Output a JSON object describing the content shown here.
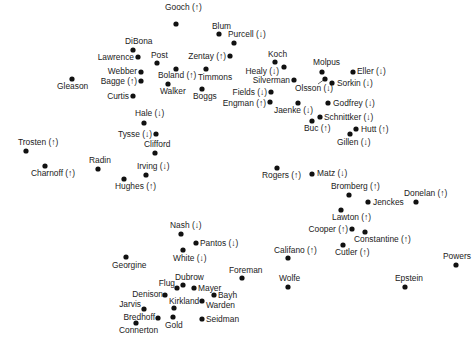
{
  "chart_data": {
    "type": "scatter",
    "title": "",
    "xlabel": "",
    "ylabel": "",
    "grid": false,
    "axes_visible": false,
    "legend": "none",
    "arrow_legend": {
      "up": "↑",
      "down": "↓"
    },
    "xlim": [
      0,
      472
    ],
    "ylim": [
      0,
      348
    ],
    "y_inverted": true,
    "coordinate_note": "arbitrary MDS-style configuration; coordinates are relative placements only",
    "points": [
      {
        "name": "Gooch",
        "arrow": "up",
        "x": 176,
        "y": 24,
        "lx": 165,
        "ly": 10,
        "anchor": "start"
      },
      {
        "name": "Blum",
        "arrow": "",
        "x": 219,
        "y": 34,
        "lx": 212,
        "ly": 29,
        "anchor": "start"
      },
      {
        "name": "Purcell",
        "arrow": "down",
        "x": 234,
        "y": 43,
        "lx": 228,
        "ly": 37,
        "anchor": "start"
      },
      {
        "name": "DiBona",
        "arrow": "",
        "x": 133,
        "y": 50,
        "lx": 125,
        "ly": 44,
        "anchor": "start"
      },
      {
        "name": "Lawrence",
        "arrow": "",
        "x": 138,
        "y": 57,
        "lx": 134,
        "ly": 60,
        "anchor": "end"
      },
      {
        "name": "Post",
        "arrow": "",
        "x": 157,
        "y": 63,
        "lx": 151,
        "ly": 58,
        "anchor": "start"
      },
      {
        "name": "Zentay",
        "arrow": "up",
        "x": 230,
        "y": 56,
        "lx": 226,
        "ly": 59,
        "anchor": "end"
      },
      {
        "name": "Koch",
        "arrow": "",
        "x": 275,
        "y": 62,
        "lx": 268,
        "ly": 57,
        "anchor": "start"
      },
      {
        "name": "Molpus",
        "arrow": "",
        "x": 322,
        "y": 72,
        "lx": 313,
        "ly": 65,
        "anchor": "start"
      },
      {
        "name": "Healy",
        "arrow": "down",
        "x": 284,
        "y": 67,
        "lx": 279,
        "ly": 74,
        "anchor": "end"
      },
      {
        "name": "Eller",
        "arrow": "down",
        "x": 353,
        "y": 72,
        "lx": 357,
        "ly": 74,
        "anchor": "start"
      },
      {
        "name": "Webber",
        "arrow": "",
        "x": 141,
        "y": 72,
        "lx": 137,
        "ly": 74,
        "anchor": "end"
      },
      {
        "name": "Boland",
        "arrow": "up",
        "x": 176,
        "y": 69,
        "lx": 158,
        "ly": 78,
        "anchor": "start"
      },
      {
        "name": "Timmons",
        "arrow": "",
        "x": 206,
        "y": 69,
        "lx": 198,
        "ly": 80,
        "anchor": "start"
      },
      {
        "name": "Silverman",
        "arrow": "",
        "x": 294,
        "y": 80,
        "lx": 290,
        "ly": 83,
        "anchor": "end"
      },
      {
        "name": "Olsson",
        "arrow": "down",
        "x": 325,
        "y": 79,
        "lx": 295,
        "ly": 91,
        "anchor": "start",
        "leader": [
          318,
          84
        ]
      },
      {
        "name": "Sorkin",
        "arrow": "down",
        "x": 332,
        "y": 83,
        "lx": 337,
        "ly": 86,
        "anchor": "start"
      },
      {
        "name": "Bagge",
        "arrow": "up",
        "x": 141,
        "y": 81,
        "lx": 137,
        "ly": 84,
        "anchor": "end"
      },
      {
        "name": "Walker",
        "arrow": "",
        "x": 168,
        "y": 84,
        "lx": 160,
        "ly": 94,
        "anchor": "start"
      },
      {
        "name": "Gleason",
        "arrow": "",
        "x": 72,
        "y": 79,
        "lx": 57,
        "ly": 89,
        "anchor": "start"
      },
      {
        "name": "Boggs",
        "arrow": "",
        "x": 202,
        "y": 89,
        "lx": 193,
        "ly": 99,
        "anchor": "start"
      },
      {
        "name": "Fields",
        "arrow": "down",
        "x": 271,
        "y": 92,
        "lx": 267,
        "ly": 95,
        "anchor": "end"
      },
      {
        "name": "Engman",
        "arrow": "up",
        "x": 270,
        "y": 102,
        "lx": 266,
        "ly": 106,
        "anchor": "end"
      },
      {
        "name": "Curtis",
        "arrow": "",
        "x": 133,
        "y": 96,
        "lx": 129,
        "ly": 99,
        "anchor": "end"
      },
      {
        "name": "Jaenke",
        "arrow": "down",
        "x": 298,
        "y": 103,
        "lx": 274,
        "ly": 113,
        "anchor": "start"
      },
      {
        "name": "Godfrey",
        "arrow": "down",
        "x": 328,
        "y": 103,
        "lx": 333,
        "ly": 106,
        "anchor": "start"
      },
      {
        "name": "Hale",
        "arrow": "down",
        "x": 144,
        "y": 123,
        "lx": 135,
        "ly": 116,
        "anchor": "start"
      },
      {
        "name": "Schnittker",
        "arrow": "down",
        "x": 320,
        "y": 117,
        "lx": 324,
        "ly": 120,
        "anchor": "start"
      },
      {
        "name": "Buc",
        "arrow": "up",
        "x": 312,
        "y": 121,
        "lx": 304,
        "ly": 131,
        "anchor": "start"
      },
      {
        "name": "Hutt",
        "arrow": "up",
        "x": 356,
        "y": 129,
        "lx": 361,
        "ly": 132,
        "anchor": "start"
      },
      {
        "name": "Gillen",
        "arrow": "down",
        "x": 350,
        "y": 134,
        "lx": 337,
        "ly": 145,
        "anchor": "start"
      },
      {
        "name": "Tysse",
        "arrow": "down",
        "x": 156,
        "y": 134,
        "lx": 152,
        "ly": 137,
        "anchor": "end"
      },
      {
        "name": "Trosten",
        "arrow": "up",
        "x": 26,
        "y": 151,
        "lx": 18,
        "ly": 145,
        "anchor": "start"
      },
      {
        "name": "Clifford",
        "arrow": "",
        "x": 155,
        "y": 153,
        "lx": 144,
        "ly": 147,
        "anchor": "start"
      },
      {
        "name": "Charnoff",
        "arrow": "up",
        "x": 45,
        "y": 166,
        "lx": 31,
        "ly": 176,
        "anchor": "start"
      },
      {
        "name": "Radin",
        "arrow": "",
        "x": 98,
        "y": 169,
        "lx": 89,
        "ly": 163,
        "anchor": "start"
      },
      {
        "name": "Irving",
        "arrow": "down",
        "x": 146,
        "y": 175,
        "lx": 137,
        "ly": 169,
        "anchor": "start"
      },
      {
        "name": "Rogers",
        "arrow": "up",
        "x": 277,
        "y": 168,
        "lx": 262,
        "ly": 178,
        "anchor": "start"
      },
      {
        "name": "Matz",
        "arrow": "down",
        "x": 312,
        "y": 174,
        "lx": 317,
        "ly": 176,
        "anchor": "start"
      },
      {
        "name": "Hughes",
        "arrow": "up",
        "x": 124,
        "y": 179,
        "lx": 115,
        "ly": 189,
        "anchor": "start"
      },
      {
        "name": "Bromberg",
        "arrow": "up",
        "x": 349,
        "y": 195,
        "lx": 331,
        "ly": 189,
        "anchor": "start"
      },
      {
        "name": "Donelan",
        "arrow": "up",
        "x": 416,
        "y": 202,
        "lx": 404,
        "ly": 196,
        "anchor": "start"
      },
      {
        "name": "Jenckes",
        "arrow": "",
        "x": 368,
        "y": 202,
        "lx": 373,
        "ly": 205,
        "anchor": "start"
      },
      {
        "name": "Lawton",
        "arrow": "up",
        "x": 341,
        "y": 210,
        "lx": 332,
        "ly": 220,
        "anchor": "start"
      },
      {
        "name": "Cooper",
        "arrow": "up",
        "x": 352,
        "y": 229,
        "lx": 348,
        "ly": 232,
        "anchor": "end"
      },
      {
        "name": "Constantine",
        "arrow": "up",
        "x": 365,
        "y": 232,
        "lx": 354,
        "ly": 242,
        "anchor": "start"
      },
      {
        "name": "Nash",
        "arrow": "down",
        "x": 181,
        "y": 234,
        "lx": 170,
        "ly": 228,
        "anchor": "start"
      },
      {
        "name": "Pantos",
        "arrow": "down",
        "x": 196,
        "y": 243,
        "lx": 200,
        "ly": 246,
        "anchor": "start"
      },
      {
        "name": "Califano",
        "arrow": "up",
        "x": 288,
        "y": 258,
        "lx": 274,
        "ly": 253,
        "anchor": "start"
      },
      {
        "name": "Cutler",
        "arrow": "up",
        "x": 343,
        "y": 245,
        "lx": 335,
        "ly": 255,
        "anchor": "start"
      },
      {
        "name": "White",
        "arrow": "down",
        "x": 183,
        "y": 250,
        "lx": 173,
        "ly": 261,
        "anchor": "start"
      },
      {
        "name": "Powers",
        "arrow": "",
        "x": 456,
        "y": 265,
        "lx": 443,
        "ly": 259,
        "anchor": "start"
      },
      {
        "name": "Georgine",
        "arrow": "",
        "x": 126,
        "y": 257,
        "lx": 112,
        "ly": 268,
        "anchor": "start"
      },
      {
        "name": "Foreman",
        "arrow": "",
        "x": 242,
        "y": 278,
        "lx": 229,
        "ly": 273,
        "anchor": "start"
      },
      {
        "name": "Dubrow",
        "arrow": "",
        "x": 183,
        "y": 285,
        "lx": 175,
        "ly": 280,
        "anchor": "start"
      },
      {
        "name": "Flug",
        "arrow": "",
        "x": 177,
        "y": 288,
        "lx": 175,
        "ly": 286,
        "anchor": "end"
      },
      {
        "name": "Mayer",
        "arrow": "",
        "x": 194,
        "y": 288,
        "lx": 198,
        "ly": 291,
        "anchor": "start"
      },
      {
        "name": "Wolfe",
        "arrow": "",
        "x": 288,
        "y": 287,
        "lx": 279,
        "ly": 281,
        "anchor": "start"
      },
      {
        "name": "Epstein",
        "arrow": "",
        "x": 405,
        "y": 287,
        "lx": 395,
        "ly": 281,
        "anchor": "start"
      },
      {
        "name": "Denison",
        "arrow": "",
        "x": 165,
        "y": 295,
        "lx": 163,
        "ly": 297,
        "anchor": "end"
      },
      {
        "name": "Bayh",
        "arrow": "",
        "x": 214,
        "y": 295,
        "lx": 218,
        "ly": 298,
        "anchor": "start"
      },
      {
        "name": "Kirkland",
        "arrow": "",
        "x": 174,
        "y": 308,
        "lx": 169,
        "ly": 304,
        "anchor": "start"
      },
      {
        "name": "Warden",
        "arrow": "",
        "x": 202,
        "y": 301,
        "lx": 206,
        "ly": 308,
        "anchor": "start"
      },
      {
        "name": "Jarvis",
        "arrow": "",
        "x": 144,
        "y": 309,
        "lx": 141,
        "ly": 307,
        "anchor": "end"
      },
      {
        "name": "Bredhoff",
        "arrow": "",
        "x": 158,
        "y": 318,
        "lx": 155,
        "ly": 320,
        "anchor": "end"
      },
      {
        "name": "Gold",
        "arrow": "",
        "x": 173,
        "y": 317,
        "lx": 165,
        "ly": 328,
        "anchor": "start"
      },
      {
        "name": "Seidman",
        "arrow": "",
        "x": 202,
        "y": 319,
        "lx": 206,
        "ly": 322,
        "anchor": "start"
      },
      {
        "name": "Connerton",
        "arrow": "",
        "x": 136,
        "y": 323,
        "lx": 119,
        "ly": 333,
        "anchor": "start"
      }
    ]
  }
}
